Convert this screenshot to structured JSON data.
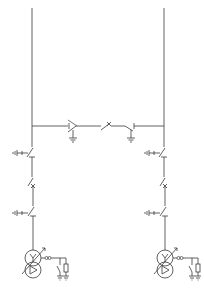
{
  "diagram": {
    "type": "single-line electrical diagram",
    "line_color": "#3a3a3a",
    "background": "#ffffff",
    "feeders": [
      {
        "id": "left",
        "x": 32,
        "components": [
          "earthing-switch",
          "disconnector",
          "circuit-breaker",
          "earthing-switch",
          "disconnector",
          "regulating-transformer",
          "arc-suppression-coil",
          "neutral-resistor"
        ]
      },
      {
        "id": "right",
        "x": 164,
        "components": [
          "earthing-switch",
          "disconnector",
          "circuit-breaker",
          "earthing-switch",
          "disconnector",
          "regulating-transformer",
          "arc-suppression-coil",
          "neutral-resistor"
        ]
      }
    ],
    "bus_tie": {
      "y": 126,
      "components": [
        "disconnector-left",
        "earth-left",
        "circuit-breaker",
        "disconnector-right",
        "earth-right"
      ]
    }
  }
}
